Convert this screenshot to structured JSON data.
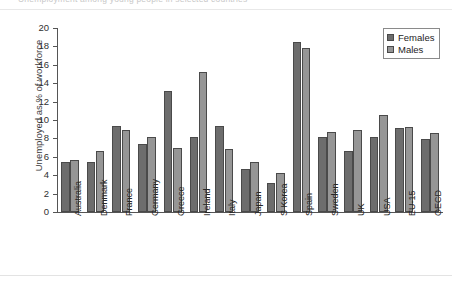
{
  "caption": {
    "text": "Unemployment among young people in selected countries"
  },
  "legend": {
    "position": "top-right",
    "entries": [
      {
        "label": "Females",
        "color": "#6d6d6d"
      },
      {
        "label": "Males",
        "color": "#969696"
      }
    ]
  },
  "axes": {
    "ylabel": "Unemployed as % of workforce",
    "yticks": [
      "0",
      "2",
      "4",
      "6",
      "8",
      "10",
      "12",
      "14",
      "16",
      "18",
      "20"
    ],
    "ymin": 0,
    "ymax": 20
  },
  "chart_data": {
    "type": "bar",
    "title": "Unemployment among young people in selected countries",
    "xlabel": "",
    "ylabel": "Unemployed as % of workforce",
    "ylim": [
      0,
      20
    ],
    "ytick_step": 2,
    "grid": false,
    "legend_position": "top-right",
    "categories": [
      "Australia",
      "Denmark",
      "France",
      "Germany",
      "Greece",
      "Ireland",
      "Italy",
      "Japan",
      "S Korea",
      "Spain",
      "Sweden",
      "UK",
      "USA",
      "EU-15",
      "OECD"
    ],
    "series": [
      {
        "name": "Females",
        "color": "#6d6d6d",
        "values": [
          5.4,
          5.4,
          9.4,
          7.4,
          13.2,
          8.1,
          9.4,
          4.7,
          3.1,
          18.5,
          8.1,
          6.6,
          8.2,
          9.1,
          7.9
        ]
      },
      {
        "name": "Males",
        "color": "#969696",
        "values": [
          5.7,
          6.6,
          8.9,
          8.2,
          7.0,
          15.2,
          6.9,
          5.4,
          4.2,
          17.8,
          8.7,
          8.9,
          10.5,
          9.2,
          8.6
        ]
      }
    ]
  }
}
